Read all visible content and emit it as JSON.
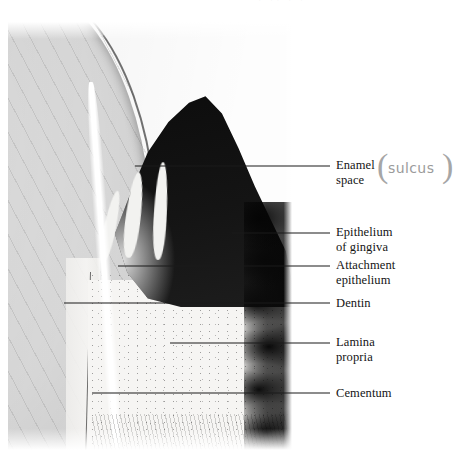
{
  "figure": {
    "name": "dental-histology-micrograph",
    "caption": "",
    "top_clipped_artifact": "· ·· · ·"
  },
  "micrograph": {
    "description": "Histologic section of the dentogingival junction showing enamel space, gingival epithelium, attachment epithelium, dentin, lamina propria and cementum",
    "regions": [
      {
        "id": "enamel-space",
        "label": "Enamel space"
      },
      {
        "id": "epithelium-of-gingiva",
        "label": "Epithelium of gingiva"
      },
      {
        "id": "attachment-epithelium",
        "label": "Attachment epithelium"
      },
      {
        "id": "dentin",
        "label": "Dentin"
      },
      {
        "id": "lamina-propria",
        "label": "Lamina propria"
      },
      {
        "id": "cementum",
        "label": "Cementum"
      }
    ]
  },
  "annotations": [
    {
      "id": "enamel-space",
      "line1": "Enamel",
      "line2": "space",
      "text": "Enamel\nspace"
    },
    {
      "id": "epithelium-of-gingiva",
      "line1": "Epithelium",
      "line2": "of gingiva",
      "text": "Epithelium\nof gingiva"
    },
    {
      "id": "attachment-epithelium",
      "line1": "Attachment",
      "line2": "epithelium",
      "text": "Attachment\nepithelium"
    },
    {
      "id": "dentin",
      "line1": "Dentin",
      "line2": "",
      "text": "Dentin"
    },
    {
      "id": "lamina-propria",
      "line1": "Lamina",
      "line2": "propria",
      "text": "Lamina\npropria"
    },
    {
      "id": "cementum",
      "line1": "Cementum",
      "line2": "",
      "text": "Cementum"
    }
  ],
  "handwritten_note": {
    "text": "sulcus",
    "open_paren": "(",
    "close_paren": ")",
    "color": "#9b9b9b"
  },
  "colors": {
    "label_text": "#141414",
    "leader_line": "#1a1a1a",
    "handwriting": "#9b9b9b",
    "background": "#ffffff",
    "tissue_dark": "#0c0c0c",
    "tissue_light": "#f6f5f3"
  }
}
